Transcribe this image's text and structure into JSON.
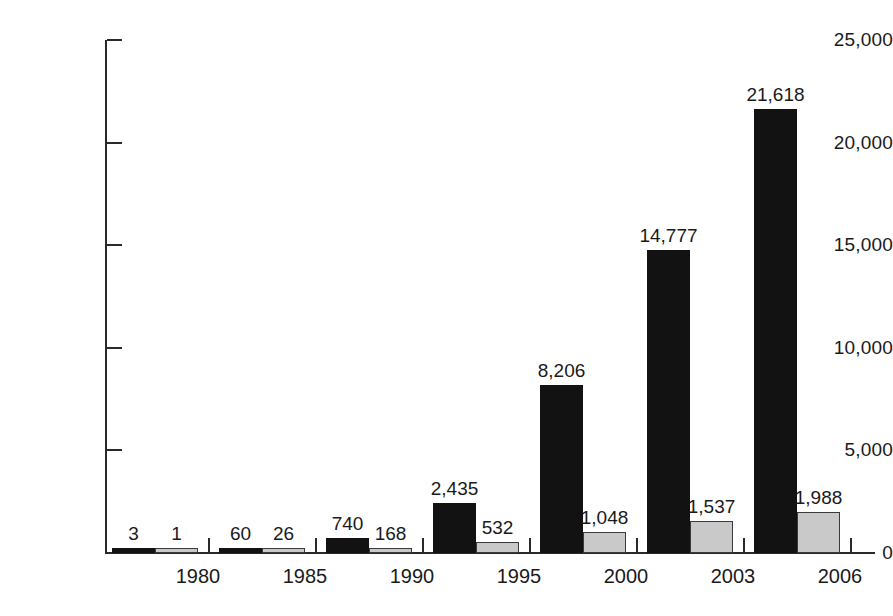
{
  "chart_data": {
    "type": "bar",
    "title": "",
    "subtitle": "",
    "xlabel": "",
    "ylabel": "",
    "ylim": [
      0,
      25000
    ],
    "yticks": [
      0,
      5000,
      10000,
      15000,
      20000,
      25000
    ],
    "ytick_labels": [
      "0",
      "5,000",
      "10,000",
      "15,000",
      "20,000",
      "25,000"
    ],
    "grid": false,
    "legend": "none",
    "categories": [
      "1980",
      "1985",
      "1990",
      "1995",
      "2000",
      "2003",
      "2006"
    ],
    "series": [
      {
        "name": "series-dark",
        "color": "#121212",
        "values": [
          3,
          60,
          740,
          2435,
          8206,
          14777,
          21618
        ],
        "labels": [
          "3",
          "60",
          "740",
          "2,435",
          "8,206",
          "14,777",
          "21,618"
        ]
      },
      {
        "name": "series-light",
        "color": "#c9c9c9",
        "values": [
          1,
          26,
          168,
          532,
          1048,
          1537,
          1988
        ],
        "labels": [
          "1",
          "26",
          "168",
          "532",
          "1,048",
          "1,537",
          "1,988"
        ]
      }
    ]
  }
}
